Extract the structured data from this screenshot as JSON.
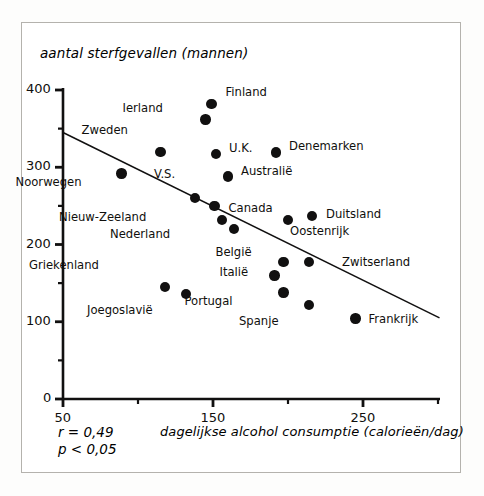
{
  "figure": {
    "y_axis_title": "aantal sterfgevallen (mannen)",
    "x_axis_title": "dagelijkse alcohol consumptie (calorieën/dag)",
    "stat_r": "r = 0,49",
    "stat_p": "p < 0,05",
    "ink_color": "#111010",
    "frame_color": "#b4b2ad"
  },
  "chart_data": {
    "type": "scatter",
    "title": "",
    "xlabel": "dagelijkse alcohol consumptie (calorieën/dag)",
    "ylabel": "aantal sterfgevallen (mannen)",
    "xlim": [
      50,
      300
    ],
    "ylim": [
      0,
      400
    ],
    "xticks": [
      50,
      100,
      150,
      200,
      250,
      300
    ],
    "xtick_labels": [
      "50",
      "",
      "150",
      "",
      "250",
      ""
    ],
    "yticks": [
      0,
      50,
      100,
      150,
      200,
      250,
      300,
      350,
      400
    ],
    "ytick_labels": [
      "0",
      "",
      "100",
      "",
      "200",
      "",
      "300",
      "",
      "400"
    ],
    "grid": false,
    "legend": false,
    "annotations": [
      "r = 0,49",
      "p < 0,05"
    ],
    "trendline": {
      "label": "regression line",
      "x_start": 50,
      "y_start": 345,
      "x_end": 301,
      "y_end": 105
    },
    "points": [
      {
        "label": "Finland",
        "x": 149,
        "y": 382,
        "label_dx": 14,
        "label_dy": -12
      },
      {
        "label": "Ierland",
        "x": 145,
        "y": 362,
        "label_dx": -55,
        "label_dy": -11
      },
      {
        "label": "Zweden",
        "x": 115,
        "y": 320,
        "label_dx": -45,
        "label_dy": -22
      },
      {
        "label": "Denemarken",
        "x": 192,
        "y": 319,
        "label_dx": 13,
        "label_dy": -7
      },
      {
        "label": "U.K.",
        "x": 152,
        "y": 317,
        "label_dx": 13,
        "label_dy": -6
      },
      {
        "label": "Noorwegen",
        "x": 89,
        "y": 292,
        "label_dx": -52,
        "label_dy": 9
      },
      {
        "label": "Australië",
        "x": 160,
        "y": 288,
        "label_dx": 13,
        "label_dy": -6
      },
      {
        "label": "V.S.",
        "x": 138,
        "y": 260,
        "label_dx": -32,
        "label_dy": -24
      },
      {
        "label": "Canada",
        "x": 151,
        "y": 250,
        "label_dx": 14,
        "label_dy": 2
      },
      {
        "label": "Duitsland",
        "x": 216,
        "y": 237,
        "label_dx": 14,
        "label_dy": -2
      },
      {
        "label": "Nieuw-Zeeland",
        "x": 156,
        "y": 232,
        "label_dx": -88,
        "label_dy": -3
      },
      {
        "label": "Oostenrijk",
        "x": 200,
        "y": 232,
        "label_dx": 2,
        "label_dy": 11
      },
      {
        "label": "Nederland",
        "x": 164,
        "y": 220,
        "label_dx": -76,
        "label_dy": 5
      },
      {
        "label": "België",
        "x": 197,
        "y": 177,
        "label_dx": -44,
        "label_dy": -10
      },
      {
        "label": "Zwitserland",
        "x": 214,
        "y": 177,
        "label_dx": 33,
        "label_dy": 0
      },
      {
        "label": "Italië",
        "x": 191,
        "y": 160,
        "label_dx": -38,
        "label_dy": -3
      },
      {
        "label": "Griekenland",
        "x": 118,
        "y": 145,
        "label_dx": -78,
        "label_dy": -22
      },
      {
        "label": "Portugal",
        "x": 197,
        "y": 138,
        "label_dx": -63,
        "label_dy": 9
      },
      {
        "label": "Joegoslavië",
        "x": 132,
        "y": 136,
        "label_dx": -45,
        "label_dy": 16
      },
      {
        "label": "Spanje",
        "x": 214,
        "y": 122,
        "label_dx": -42,
        "label_dy": 16
      },
      {
        "label": "Frankrijk",
        "x": 245,
        "y": 104,
        "label_dx": 13,
        "label_dy": 0
      }
    ]
  }
}
